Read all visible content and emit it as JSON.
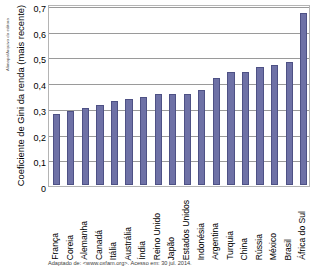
{
  "credit": "Alimapa/Arquivo da editora",
  "source_note": "Adaptado de: <www.oxfam.org>. Acesso em: 30 jul. 2014.",
  "chart_data": {
    "type": "bar",
    "title": "",
    "xlabel": "",
    "ylabel": "Coeficiente de Gini da renda (mais recente)",
    "ylim": [
      0,
      0.7
    ],
    "grid": true,
    "legend": "none",
    "bar_color": "#6e71a6",
    "bar_edge_color": "#4e5185",
    "ytick_labels": [
      "0",
      "0,1",
      "0,2",
      "0,3",
      "0,4",
      "0,5",
      "0,6",
      "0,7"
    ],
    "ytick_values": [
      0,
      0.1,
      0.2,
      0.3,
      0.4,
      0.5,
      0.6,
      0.7
    ],
    "categories": [
      "França",
      "Coreia",
      "Alemanha",
      "Canadá",
      "Itália",
      "Austrália",
      "Índia",
      "Reino Unido",
      "Japão",
      "Estados Unidos",
      "Indonésia",
      "Argentina",
      "Turquia",
      "China",
      "Rússia",
      "México",
      "Brasil",
      "África do Sul"
    ],
    "values": [
      0.275,
      0.288,
      0.3,
      0.312,
      0.328,
      0.333,
      0.341,
      0.354,
      0.354,
      0.354,
      0.37,
      0.418,
      0.44,
      0.439,
      0.46,
      0.467,
      0.477,
      0.668
    ]
  }
}
